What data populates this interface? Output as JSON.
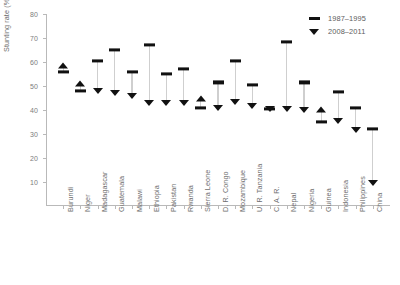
{
  "chart_data": {
    "type": "scatter",
    "title": "",
    "xlabel": "",
    "ylabel": "Stunting rate (%)",
    "ylim": [
      0,
      80
    ],
    "yticks": [
      10,
      20,
      30,
      40,
      50,
      60,
      70,
      80
    ],
    "grid": false,
    "legend_position": "top-right",
    "categories": [
      "Burundi",
      "Niger",
      "Madagascar",
      "Guatemala",
      "Malawi",
      "Ethiopia",
      "Pakistan",
      "Rwanda",
      "Sierra Leone",
      "D. R. Congo",
      "Mozambique",
      "U. R. Tanzania",
      "C. A. R.",
      "Nepal",
      "Nigeria",
      "Guinea",
      "Indonesia",
      "Philippines",
      "China"
    ],
    "series": [
      {
        "name": "1987–1995",
        "marker": "dash",
        "values": [
          56.0,
          48.0,
          60.5,
          65.0,
          56.0,
          67.0,
          55.0,
          57.0,
          41.0,
          51.5,
          60.5,
          50.5,
          40.5,
          68.5,
          51.5,
          35.0,
          47.5,
          41.0,
          32.0
        ]
      },
      {
        "name": "2008–2011",
        "marker": "triangle",
        "values": [
          58.5,
          51.0,
          48.0,
          47.0,
          46.0,
          43.0,
          43.0,
          43.0,
          44.5,
          41.0,
          43.5,
          41.5,
          40.5,
          40.5,
          40.0,
          40.0,
          35.5,
          31.5,
          9.5
        ]
      }
    ],
    "directions": [
      "up",
      "up",
      "down",
      "down",
      "down",
      "down",
      "down",
      "down",
      "up",
      "down",
      "down",
      "down",
      "down",
      "down",
      "down",
      "up",
      "down",
      "down",
      "down"
    ]
  },
  "legend": {
    "items": [
      {
        "label": "1987–1995",
        "marker": "dash"
      },
      {
        "label": "2008–2011",
        "marker": "triangle-down"
      }
    ]
  },
  "axis": {
    "y_title": "Stunting rate (%)"
  }
}
